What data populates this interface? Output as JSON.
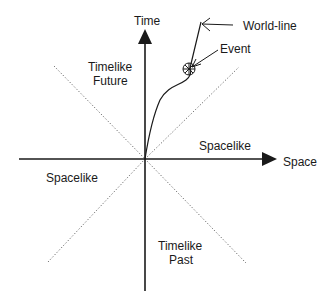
{
  "diagram": {
    "type": "spacetime-light-cone",
    "axes": {
      "time_label": "Time",
      "space_label": "Space"
    },
    "regions": {
      "future": [
        "Timelike",
        "Future"
      ],
      "past": [
        "Timelike",
        "Past"
      ],
      "spacelike_right": "Spacelike",
      "spacelike_left": "Spacelike"
    },
    "annotations": {
      "world_line": "World-line",
      "event": "Event"
    },
    "colors": {
      "ink": "#1a1a1a",
      "dotted": "#666666",
      "background": "#ffffff"
    }
  }
}
